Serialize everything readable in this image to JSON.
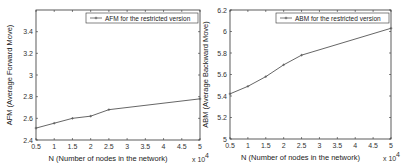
{
  "chart_data": [
    {
      "type": "line",
      "title": "",
      "xlabel": "N (Number of nodes in the network)",
      "xscale_note": "x 10^4",
      "ylabel": "AFM (Average Forward Move)",
      "xlim": [
        0.5,
        5
      ],
      "ylim": [
        2.4,
        3.6
      ],
      "xticks": [
        "0.5",
        "1",
        "1.5",
        "2",
        "2.5",
        "3",
        "3.5",
        "4",
        "4.5",
        "5"
      ],
      "yticks": [
        "2.4",
        "2.6",
        "2.8",
        "3",
        "3.2",
        "3.4"
      ],
      "grid": false,
      "legend_position": "upper right",
      "series": [
        {
          "name": "AFM for the restricted version",
          "x": [
            0.5,
            1,
            1.5,
            2,
            2.5,
            5
          ],
          "values": [
            2.51,
            2.555,
            2.6,
            2.62,
            2.68,
            2.78
          ]
        }
      ]
    },
    {
      "type": "line",
      "title": "",
      "xlabel": "N (Number of nodes in the network)",
      "xscale_note": "x 10^4",
      "ylabel": "ABM (Average Backward Move)",
      "xlim": [
        0.5,
        5
      ],
      "ylim": [
        5,
        6.2
      ],
      "xticks": [
        "0.5",
        "1",
        "1.5",
        "2",
        "2.5",
        "3",
        "3.5",
        "4",
        "4.5",
        "5"
      ],
      "yticks": [
        "5",
        "5.2",
        "5.4",
        "5.6",
        "5.8",
        "6",
        "6.2"
      ],
      "grid": false,
      "legend_position": "upper right",
      "series": [
        {
          "name": "ABM for the restricted version",
          "x": [
            0.5,
            1,
            1.5,
            2,
            2.5,
            5
          ],
          "values": [
            5.42,
            5.49,
            5.58,
            5.69,
            5.78,
            6.03
          ]
        }
      ]
    }
  ],
  "colors": {
    "line": "#555555",
    "axis": "#333333"
  }
}
